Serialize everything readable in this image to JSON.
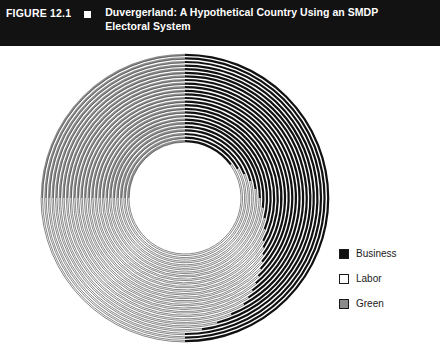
{
  "header": {
    "figure_number": "FIGURE 12.1",
    "marker_icon": "square-marker-icon",
    "title": "Duvergerland: A Hypothetical Country Using an SMDP Electoral System"
  },
  "legend": {
    "position": "right",
    "items": [
      {
        "label": "Business",
        "color": "#111111",
        "swatch": "filled-black"
      },
      {
        "label": "Labor",
        "color": "#ffffff",
        "swatch": "outlined-white"
      },
      {
        "label": "Green",
        "color": "#8c8c8c",
        "swatch": "filled-gray"
      }
    ]
  },
  "chart_data": {
    "type": "pie",
    "title": "Duvergerland: A Hypothetical Country Using an SMDP Electoral System",
    "subtitle": "",
    "xlabel": "",
    "ylabel": "",
    "legend_position": "right",
    "grid": false,
    "parties": [
      "Business",
      "Labor",
      "Green"
    ],
    "colors": {
      "Business": "#111111",
      "Labor": "#ffffff",
      "Green": "#8c8c8c"
    },
    "geometry": {
      "start_angle_deg": 0,
      "direction": "clockwise",
      "outer_radius_px": 145,
      "inner_radius_px": 55,
      "ring_count": 25,
      "center_x_px": 185,
      "center_y_px": 152
    },
    "categories": [
      "District 1",
      "District 2",
      "District 3",
      "District 4",
      "District 5",
      "District 6",
      "District 7",
      "District 8",
      "District 9",
      "District 10",
      "District 11",
      "District 12",
      "District 13",
      "District 14",
      "District 15",
      "District 16",
      "District 17",
      "District 18",
      "District 19",
      "District 20",
      "District 21",
      "District 22",
      "District 23",
      "District 24",
      "District 25"
    ],
    "series": [
      {
        "name": "Business",
        "values": [
          50,
          50,
          50,
          48,
          46,
          44,
          42,
          41,
          40,
          39,
          38,
          37,
          36,
          35,
          34,
          33,
          31,
          29,
          27,
          25,
          23,
          21,
          19,
          17,
          15
        ]
      },
      {
        "name": "Labor",
        "values": [
          25,
          25,
          25,
          27,
          29,
          31,
          33,
          34,
          35,
          36,
          37,
          38,
          39,
          40,
          41,
          42,
          44,
          46,
          48,
          50,
          52,
          54,
          56,
          58,
          60
        ]
      },
      {
        "name": "Green",
        "values": [
          25,
          25,
          25,
          25,
          25,
          25,
          25,
          25,
          25,
          25,
          25,
          25,
          25,
          25,
          25,
          25,
          25,
          25,
          25,
          25,
          25,
          25,
          25,
          25,
          25
        ]
      }
    ],
    "units": "percent of district vote",
    "ylim": [
      0,
      100
    ]
  }
}
